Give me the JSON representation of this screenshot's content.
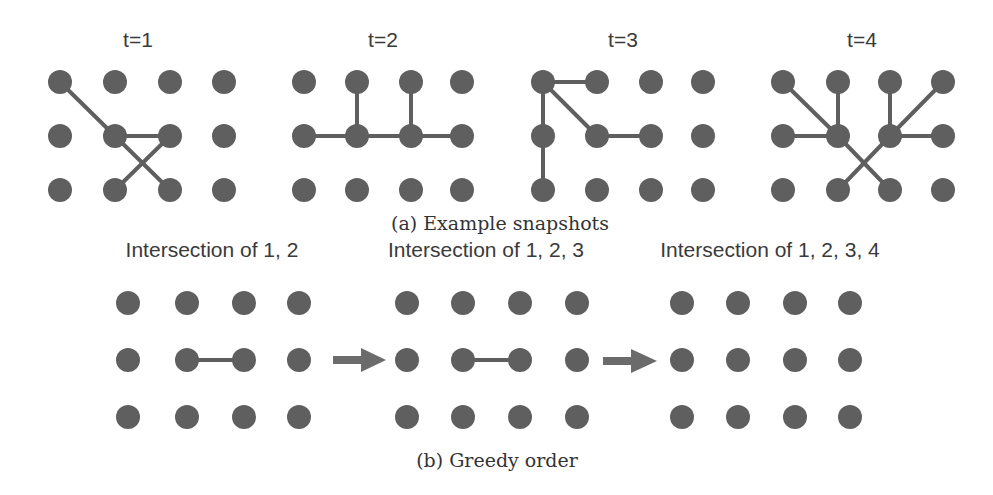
{
  "figure": {
    "colors": {
      "node": "#5f5f5f",
      "edge": "#5f5f5f",
      "arrow": "#6b6b6b",
      "text": "#3a3a3a"
    },
    "grid": {
      "columns": 4,
      "rows": 3,
      "node_radius": 12
    },
    "part_a": {
      "caption": "(a) Example snapshots",
      "snapshots": [
        {
          "label": "t=1",
          "edges": [
            [
              [
                0,
                0
              ],
              [
                1,
                1
              ]
            ],
            [
              [
                1,
                1
              ],
              [
                2,
                1
              ]
            ],
            [
              [
                1,
                1
              ],
              [
                2,
                2
              ]
            ],
            [
              [
                1,
                2
              ],
              [
                2,
                1
              ]
            ]
          ]
        },
        {
          "label": "t=2",
          "edges": [
            [
              [
                0,
                1
              ],
              [
                1,
                1
              ]
            ],
            [
              [
                1,
                0
              ],
              [
                1,
                1
              ]
            ],
            [
              [
                1,
                1
              ],
              [
                2,
                1
              ]
            ],
            [
              [
                2,
                0
              ],
              [
                2,
                1
              ]
            ],
            [
              [
                2,
                1
              ],
              [
                3,
                1
              ]
            ]
          ]
        },
        {
          "label": "t=3",
          "edges": [
            [
              [
                0,
                0
              ],
              [
                1,
                0
              ]
            ],
            [
              [
                0,
                0
              ],
              [
                0,
                1
              ]
            ],
            [
              [
                0,
                1
              ],
              [
                0,
                2
              ]
            ],
            [
              [
                0,
                0
              ],
              [
                1,
                1
              ]
            ],
            [
              [
                1,
                1
              ],
              [
                2,
                1
              ]
            ]
          ]
        },
        {
          "label": "t=4",
          "edges": [
            [
              [
                0,
                0
              ],
              [
                1,
                1
              ]
            ],
            [
              [
                1,
                0
              ],
              [
                1,
                1
              ]
            ],
            [
              [
                0,
                1
              ],
              [
                1,
                1
              ]
            ],
            [
              [
                1,
                1
              ],
              [
                2,
                2
              ]
            ],
            [
              [
                2,
                0
              ],
              [
                2,
                1
              ]
            ],
            [
              [
                3,
                0
              ],
              [
                2,
                1
              ]
            ],
            [
              [
                2,
                1
              ],
              [
                3,
                1
              ]
            ],
            [
              [
                2,
                1
              ],
              [
                1,
                2
              ]
            ]
          ]
        }
      ]
    },
    "part_b": {
      "caption": "(b) Greedy order",
      "steps": [
        {
          "label": "Intersection of 1, 2",
          "edges": [
            [
              [
                1,
                1
              ],
              [
                2,
                1
              ]
            ]
          ]
        },
        {
          "label": "Intersection of 1, 2, 3",
          "edges": [
            [
              [
                1,
                1
              ],
              [
                2,
                1
              ]
            ]
          ]
        },
        {
          "label": "Intersection of 1, 2, 3, 4",
          "edges": []
        }
      ],
      "arrows": [
        "right-arrow",
        "right-arrow"
      ]
    }
  }
}
